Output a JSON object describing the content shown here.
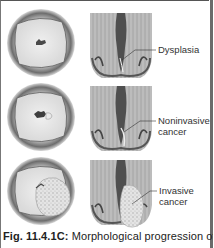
{
  "figure": {
    "panels": [
      {
        "stage": "dysplasia",
        "label_lines": [
          "Dysplasia"
        ]
      },
      {
        "stage": "noninvasive",
        "label_lines": [
          "Noninvasive",
          "cancer"
        ]
      },
      {
        "stage": "invasive",
        "label_lines": [
          "Invasive",
          "cancer"
        ]
      }
    ],
    "caption": {
      "number": "Fig. 11.4.1C:",
      "text": " Morphological progression of"
    }
  }
}
